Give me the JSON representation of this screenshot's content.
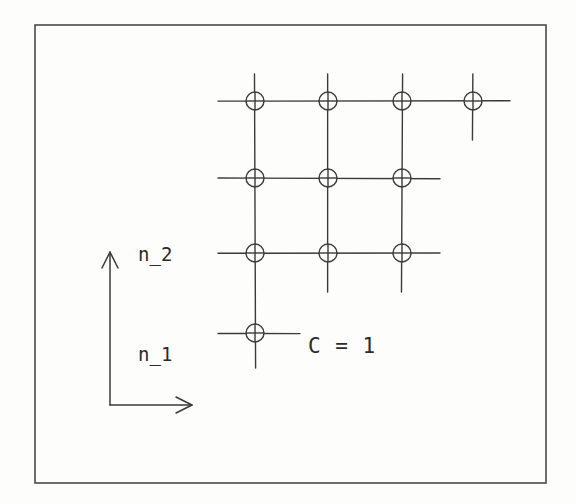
{
  "figure": {
    "background_color": "#fdfdfc",
    "ink_color": "#3a3a3a",
    "border": {
      "name": "figure-border",
      "x": 35,
      "y": 25,
      "width": 511,
      "height": 458,
      "stroke": "#4a4a4a",
      "stroke_width": 1.6
    }
  },
  "axes": {
    "origin": {
      "x": 110,
      "y": 405
    },
    "vertical": {
      "label": "n_2",
      "label_x": 138,
      "label_y": 245,
      "tip_x": 110,
      "tip_y": 252,
      "base_x": 110,
      "base_y": 405
    },
    "horizontal": {
      "label": "n_1",
      "label_x": 138,
      "label_y": 345,
      "base_x": 110,
      "base_y": 405,
      "tip_x": 192,
      "tip_y": 405
    },
    "stroke": "#3a3a3a",
    "stroke_width": 1.5
  },
  "caption": {
    "text": "C = 1",
    "x": 308,
    "y": 336
  },
  "lattice": {
    "node_radius": 9,
    "stub": 22,
    "stroke": "#3a3a3a",
    "stroke_width": 1.4,
    "columns_x": [
      255,
      328,
      402,
      473
    ],
    "rows_y": [
      101,
      178,
      253,
      333
    ],
    "row_counts": [
      4,
      3,
      3,
      1
    ],
    "column_counts": [
      4,
      3,
      3,
      1
    ],
    "nodes": [
      {
        "row": 0,
        "col": 0,
        "x": 255,
        "y": 101
      },
      {
        "row": 0,
        "col": 1,
        "x": 328,
        "y": 101
      },
      {
        "row": 0,
        "col": 2,
        "x": 402,
        "y": 101
      },
      {
        "row": 0,
        "col": 3,
        "x": 473,
        "y": 101
      },
      {
        "row": 1,
        "col": 0,
        "x": 255,
        "y": 178
      },
      {
        "row": 1,
        "col": 1,
        "x": 328,
        "y": 178
      },
      {
        "row": 1,
        "col": 2,
        "x": 402,
        "y": 178
      },
      {
        "row": 2,
        "col": 0,
        "x": 255,
        "y": 253
      },
      {
        "row": 2,
        "col": 1,
        "x": 328,
        "y": 253
      },
      {
        "row": 2,
        "col": 2,
        "x": 402,
        "y": 253
      },
      {
        "row": 3,
        "col": 0,
        "x": 255,
        "y": 333
      }
    ],
    "horizontal_lines": [
      {
        "y": 101,
        "x1": 218,
        "x2": 510
      },
      {
        "y": 178,
        "x1": 218,
        "x2": 440
      },
      {
        "y": 253,
        "x1": 218,
        "x2": 440
      },
      {
        "y": 333,
        "x1": 218,
        "x2": 300
      }
    ],
    "vertical_lines": [
      {
        "x": 255,
        "y1": 74,
        "y2": 368
      },
      {
        "x": 328,
        "y1": 74,
        "y2": 292
      },
      {
        "x": 402,
        "y1": 74,
        "y2": 292
      },
      {
        "x": 473,
        "y1": 74,
        "y2": 140
      }
    ]
  },
  "chart_data": {
    "type": "scatter",
    "title": "C = 1",
    "xlabel": "n_1",
    "ylabel": "n_2",
    "x": [
      1,
      2,
      3,
      4,
      1,
      2,
      3,
      1,
      2,
      3,
      1
    ],
    "y": [
      4,
      4,
      4,
      4,
      3,
      3,
      3,
      2,
      2,
      2,
      1
    ],
    "categories": [
      "col-1",
      "col-2",
      "col-3",
      "col-4"
    ],
    "series": [
      {
        "name": "row-4 (top)",
        "values": [
          1,
          1,
          1,
          1
        ]
      },
      {
        "name": "row-3",
        "values": [
          1,
          1,
          1,
          0
        ]
      },
      {
        "name": "row-2",
        "values": [
          1,
          1,
          1,
          0
        ]
      },
      {
        "name": "row-1 (bottom)",
        "values": [
          1,
          0,
          0,
          0
        ]
      }
    ],
    "grid": true,
    "legend": "none",
    "xlim": [
      0,
      5
    ],
    "ylim": [
      0,
      5
    ]
  }
}
